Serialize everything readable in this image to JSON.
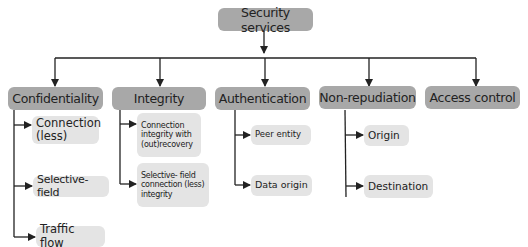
{
  "root": {
    "label": "Security services"
  },
  "categories": [
    {
      "label": "Confidentiality",
      "children": [
        {
          "label": "Connection (less)"
        },
        {
          "label": "Selective-field"
        },
        {
          "label": "Traffic flow"
        }
      ]
    },
    {
      "label": "Integrity",
      "children": [
        {
          "label": "Connection integrity with (out)recovery"
        },
        {
          "label": "Selective- field connection (less) integrity"
        }
      ]
    },
    {
      "label": "Authentication",
      "children": [
        {
          "label": "Peer entity"
        },
        {
          "label": "Data origin"
        }
      ]
    },
    {
      "label": "Non-repudiation",
      "children": [
        {
          "label": "Origin"
        },
        {
          "label": "Destination"
        }
      ]
    },
    {
      "label": "Access control",
      "children": []
    }
  ],
  "colors": {
    "main_box": "#a8a8a8",
    "child_box": "#e4e4e4",
    "line": "#222222",
    "text": "#222222"
  }
}
